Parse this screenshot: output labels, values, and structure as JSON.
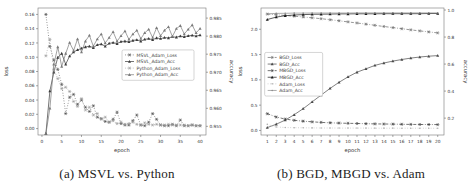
{
  "figure": {
    "captions": {
      "a": "(a) MSVL vs. Python",
      "b": "(b) BGD, MBGD vs. Adam"
    }
  },
  "chart_data": [
    {
      "id": "a",
      "type": "line",
      "title": "",
      "xlabel": "epoch",
      "ylabel_left": "loss",
      "ylabel_right": "accuracy",
      "xlim": [
        -1,
        41.5
      ],
      "ylim_left": [
        -0.009,
        0.169
      ],
      "ylim_right": [
        0.9526,
        0.9878
      ],
      "xticks": [
        "0",
        "5",
        "10",
        "15",
        "20",
        "25",
        "30",
        "35",
        "40"
      ],
      "yticks_left": [
        "0.00",
        "0.02",
        "0.04",
        "0.06",
        "0.08",
        "0.10",
        "0.12",
        "0.14",
        "0.16"
      ],
      "yticks_right": [
        "0.955",
        "0.960",
        "0.965",
        "0.970",
        "0.975",
        "0.980",
        "0.985"
      ],
      "grid": false,
      "legend": {
        "position": "center-right",
        "x": 0.5,
        "y": 0.33,
        "w": 72
      },
      "margins": {
        "l": 38,
        "r": 28,
        "t": 8,
        "b": 28
      },
      "series": [
        {
          "name": "MSVL_Adam_Loss",
          "axis": "left",
          "marker": "star",
          "line": "dotted",
          "color": "#4a4a4a",
          "values": [
            0.16,
            0.115,
            0.096,
            0.083,
            0.062,
            0.021,
            0.044,
            0.048,
            0.034,
            0.04,
            0.03,
            0.024,
            0.032,
            0.016,
            0.014,
            0.01,
            0.009,
            0.013,
            0.023,
            0.007,
            0.005,
            0.005,
            0.011,
            0.019,
            0.005,
            0.004,
            0.009,
            0.021,
            0.013,
            0.005,
            0.004,
            0.004,
            0.006,
            0.004,
            0.012,
            0.004,
            0.004,
            0.005,
            0.004,
            0.004
          ]
        },
        {
          "name": "MSVL_Adam_Acc",
          "axis": "right",
          "marker": "triangle",
          "line": "solid",
          "color": "#3a3a3a",
          "values": [
            0.953,
            0.9648,
            0.97,
            0.9741,
            0.9752,
            0.9722,
            0.9745,
            0.9756,
            0.9762,
            0.9766,
            0.977,
            0.9772,
            0.9768,
            0.9776,
            0.9778,
            0.9772,
            0.978,
            0.9782,
            0.9779,
            0.9785,
            0.9786,
            0.9784,
            0.9788,
            0.979,
            0.9786,
            0.9791,
            0.9793,
            0.979,
            0.9795,
            0.9793,
            0.9796,
            0.9795,
            0.9798,
            0.9797,
            0.98,
            0.9798,
            0.9801,
            0.9802,
            0.98,
            0.9803
          ]
        },
        {
          "name": "Python_Adam_Loss",
          "axis": "left",
          "marker": "star",
          "line": "dotted",
          "color": "#9a9a9a",
          "values": [
            0.102,
            0.125,
            0.083,
            0.07,
            0.056,
            0.058,
            0.052,
            0.038,
            0.031,
            0.042,
            0.026,
            0.03,
            0.019,
            0.021,
            0.013,
            0.016,
            0.009,
            0.011,
            0.007,
            0.009,
            0.006,
            0.007,
            0.009,
            0.006,
            0.005,
            0.008,
            0.006,
            0.005,
            0.006,
            0.005,
            0.005,
            0.006,
            0.005,
            0.005,
            0.005,
            0.005,
            0.004,
            0.005,
            0.004,
            0.004
          ]
        },
        {
          "name": "Python_Adam_Acc",
          "axis": "right",
          "marker": "triangle",
          "line": "solid",
          "color": "#7a7a7a",
          "values": [
            0.953,
            0.96,
            0.9722,
            0.977,
            0.9716,
            0.9752,
            0.9782,
            0.976,
            0.9792,
            0.9756,
            0.9786,
            0.9802,
            0.9772,
            0.9792,
            0.9806,
            0.9781,
            0.9796,
            0.9812,
            0.9786,
            0.9801,
            0.9814,
            0.9791,
            0.9806,
            0.9816,
            0.9793,
            0.9809,
            0.9819,
            0.9796,
            0.9823,
            0.9801,
            0.9816,
            0.9826,
            0.9799,
            0.9821,
            0.9829,
            0.9806,
            0.9819,
            0.9831,
            0.9809,
            0.9821
          ]
        }
      ]
    },
    {
      "id": "b",
      "type": "line",
      "title": "",
      "xlabel": "epoch",
      "ylabel_left": "loss",
      "ylabel_right": "accuracy",
      "xlim": [
        0.3,
        20.7
      ],
      "ylim_left": [
        -0.09,
        2.42
      ],
      "ylim_right": [
        0.075,
        1.015
      ],
      "xticks": [
        "1",
        "2",
        "3",
        "4",
        "5",
        "6",
        "7",
        "8",
        "9",
        "10",
        "11",
        "12",
        "13",
        "14",
        "15",
        "16",
        "17",
        "18",
        "19",
        "20"
      ],
      "yticks_left": [
        "0.0",
        "0.5",
        "1.0",
        "1.5",
        "2.0"
      ],
      "yticks_right": [
        "0.2",
        "0.4",
        "0.6",
        "0.8",
        "1.0"
      ],
      "grid": false,
      "legend": {
        "position": "left-middle",
        "x": 0.02,
        "y": 0.35,
        "w": 58
      },
      "margins": {
        "l": 27,
        "r": 24,
        "t": 8,
        "b": 28
      },
      "series": [
        {
          "name": "BGD_Loss",
          "axis": "left",
          "marker": "star",
          "line": "dashdot",
          "color": "#6a6a6a",
          "values": [
            2.3,
            2.285,
            2.272,
            2.258,
            2.243,
            2.226,
            2.208,
            2.188,
            2.168,
            2.146,
            2.124,
            2.101,
            2.078,
            2.055,
            2.032,
            2.01,
            1.988,
            1.967,
            1.947,
            1.928
          ]
        },
        {
          "name": "BGD_Acc",
          "axis": "right",
          "marker": "triangle",
          "line": "solid",
          "color": "#4a4a4a",
          "values": [
            0.13,
            0.155,
            0.185,
            0.225,
            0.27,
            0.32,
            0.37,
            0.42,
            0.465,
            0.505,
            0.54,
            0.565,
            0.59,
            0.608,
            0.622,
            0.634,
            0.644,
            0.652,
            0.658,
            0.663
          ]
        },
        {
          "name": "MBGD_Loss",
          "axis": "left",
          "marker": "star",
          "line": "dashdot",
          "color": "#3a3a3a",
          "values": [
            0.33,
            0.265,
            0.225,
            0.2,
            0.183,
            0.17,
            0.16,
            0.152,
            0.146,
            0.141,
            0.137,
            0.133,
            0.13,
            0.127,
            0.125,
            0.122,
            0.12,
            0.118,
            0.117,
            0.115
          ]
        },
        {
          "name": "MBGD_Acc",
          "axis": "right",
          "marker": "triangle",
          "line": "solid",
          "color": "#1a1a1a",
          "values": [
            0.93,
            0.948,
            0.958,
            0.963,
            0.966,
            0.968,
            0.969,
            0.97,
            0.971,
            0.971,
            0.972,
            0.972,
            0.972,
            0.973,
            0.973,
            0.973,
            0.973,
            0.973,
            0.974,
            0.974
          ]
        },
        {
          "name": "Adam_Loss",
          "axis": "left",
          "marker": "dot",
          "line": "dotted",
          "color": "#b0b0b0",
          "values": [
            0.12,
            0.068,
            0.058,
            0.054,
            0.052,
            0.05,
            0.049,
            0.048,
            0.047,
            0.047,
            0.046,
            0.046,
            0.045,
            0.045,
            0.045,
            0.044,
            0.044,
            0.044,
            0.044,
            0.043
          ]
        },
        {
          "name": "Adam_Acc",
          "axis": "right",
          "marker": "dot",
          "line": "solid",
          "color": "#8a8a8a",
          "values": [
            0.972,
            0.975,
            0.976,
            0.977,
            0.977,
            0.978,
            0.978,
            0.978,
            0.978,
            0.978,
            0.979,
            0.979,
            0.979,
            0.979,
            0.979,
            0.979,
            0.979,
            0.979,
            0.979,
            0.979
          ]
        }
      ]
    }
  ]
}
